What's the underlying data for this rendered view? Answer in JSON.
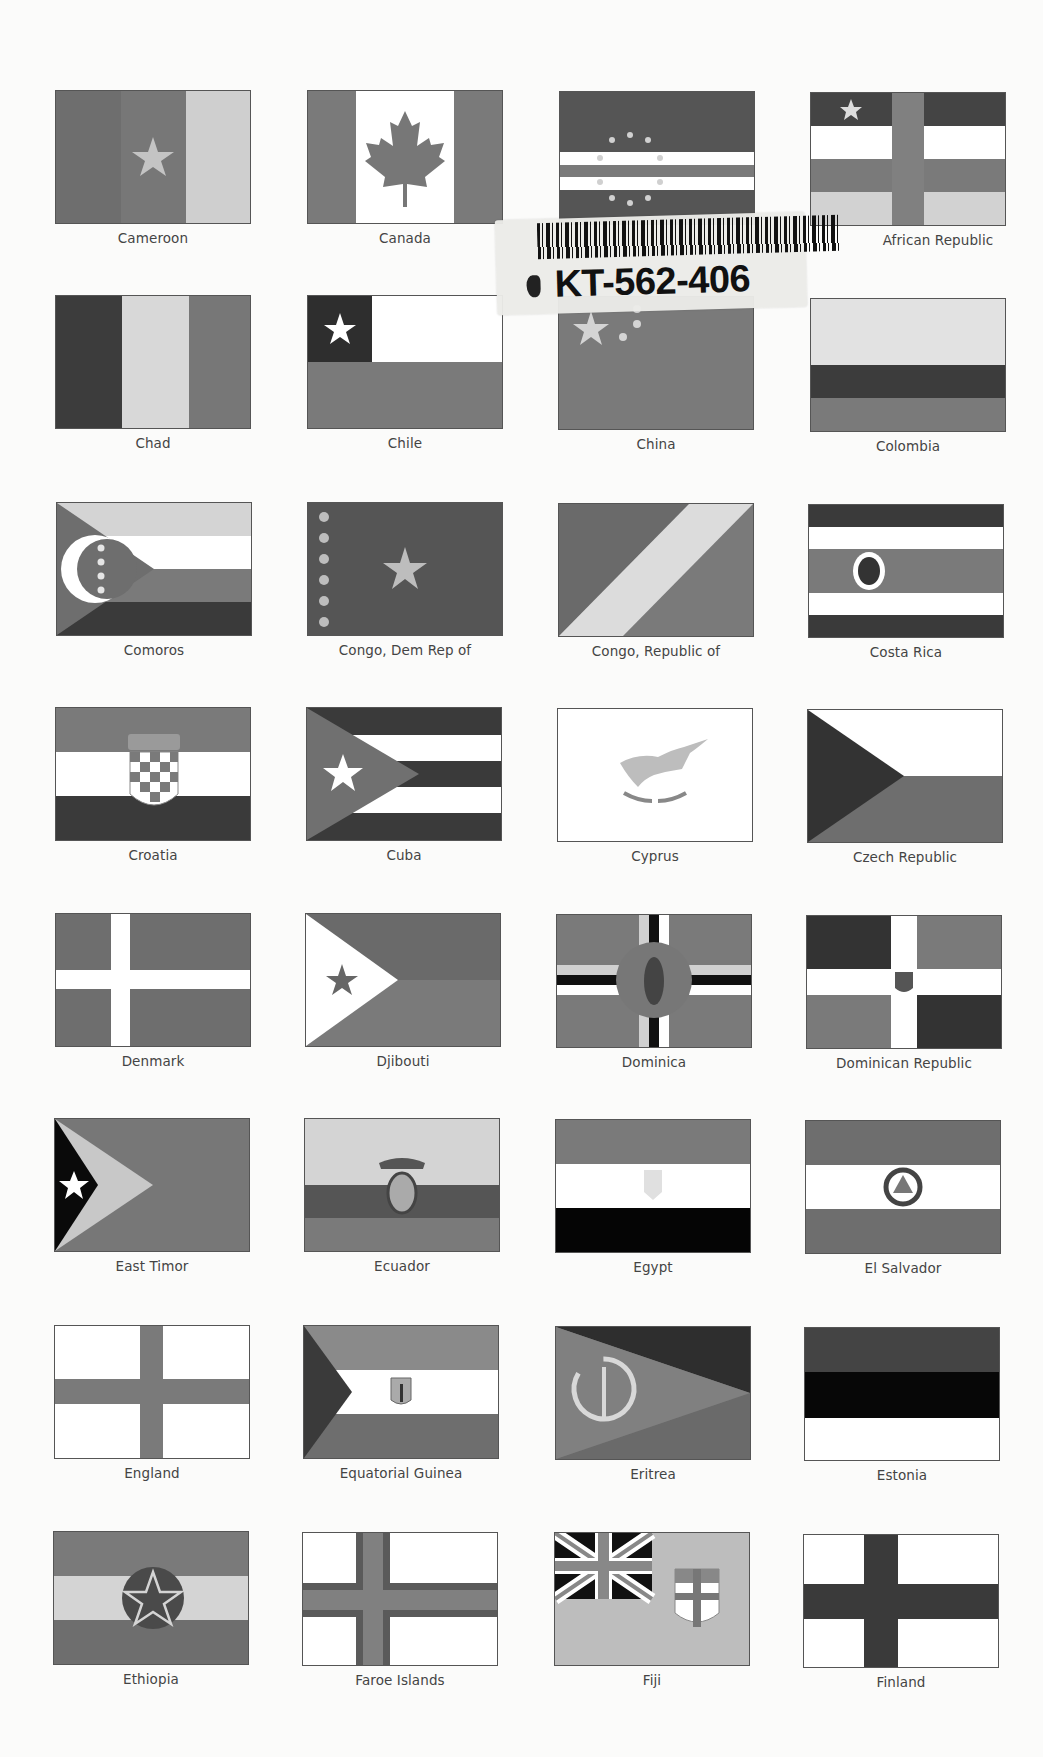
{
  "page": {
    "background": "#fbfbfa"
  },
  "sticker": {
    "code": "KT-562-406",
    "barcode": "barcode"
  },
  "colors": {
    "dark": "#3a3a3a",
    "mid": "#7a7a7a",
    "light": "#bdbdbd",
    "lighter": "#d8d8d8",
    "white": "#ffffff",
    "black": "#0a0a0a"
  },
  "flags": [
    {
      "name": "Cameroon"
    },
    {
      "name": "Canada"
    },
    {
      "name": "Cape Verde"
    },
    {
      "name": "Central African Republic",
      "visible_label": "African Republic"
    },
    {
      "name": "Chad"
    },
    {
      "name": "Chile"
    },
    {
      "name": "China"
    },
    {
      "name": "Colombia"
    },
    {
      "name": "Comoros"
    },
    {
      "name": "Congo, Dem Rep of"
    },
    {
      "name": "Congo, Republic of"
    },
    {
      "name": "Costa Rica"
    },
    {
      "name": "Croatia"
    },
    {
      "name": "Cuba"
    },
    {
      "name": "Cyprus"
    },
    {
      "name": "Czech Republic"
    },
    {
      "name": "Denmark"
    },
    {
      "name": "Djibouti"
    },
    {
      "name": "Dominica"
    },
    {
      "name": "Dominican Republic"
    },
    {
      "name": "East Timor"
    },
    {
      "name": "Ecuador"
    },
    {
      "name": "Egypt"
    },
    {
      "name": "El Salvador"
    },
    {
      "name": "England"
    },
    {
      "name": "Equatorial Guinea"
    },
    {
      "name": "Eritrea"
    },
    {
      "name": "Estonia"
    },
    {
      "name": "Ethiopia"
    },
    {
      "name": "Faroe Islands"
    },
    {
      "name": "Fiji"
    },
    {
      "name": "Finland"
    }
  ]
}
